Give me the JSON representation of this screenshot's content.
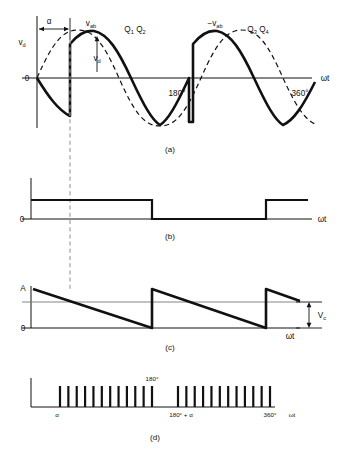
{
  "figure": {
    "panels": [
      {
        "id": "a",
        "label": "(a)"
      },
      {
        "id": "b",
        "label": "(b)"
      },
      {
        "id": "c",
        "label": "(c)"
      },
      {
        "id": "d",
        "label": "(d)"
      }
    ],
    "colors": {
      "ink": "#111111",
      "reference_line": "#777777",
      "dashed_guide": "#999999",
      "background": "#ffffff"
    }
  },
  "panel_a": {
    "y_axis_label": "v_d",
    "y_axis_label_html": "v<sub>d</sub>",
    "origin_label": "0",
    "x_axis_label": "ωt",
    "alpha_label": "α",
    "vab_label": "v_ab",
    "neg_vab_label": "−v_ab",
    "vd_arrow_label": "v_d",
    "thyristor_pair_1": "Q₁Q₂",
    "thyristor_pair_2": "Q₃Q₄",
    "tick_180": "180°",
    "tick_360": "360°"
  },
  "panel_b": {
    "origin_label": "0",
    "x_axis_label": "ωt"
  },
  "panel_c": {
    "amplitude_label": "A",
    "origin_label": "0",
    "x_axis_label": "ωt",
    "control_voltage_label": "V_c"
  },
  "panel_d": {
    "alpha_label": "α",
    "tick_180": "180°",
    "tick_180_plus_alpha": "180° + α",
    "tick_360": "360°",
    "x_axis_label": "ωt",
    "pulse_group_1_count": 12,
    "pulse_group_2_count": 12
  },
  "chart_data": {
    "type": "line",
    "xlabel": "ωt",
    "x_ticks": [
      0,
      180,
      360
    ],
    "x_tick_labels": [
      "0",
      "180°",
      "360°"
    ],
    "firing_angle_alpha_deg": 55,
    "subplots": [
      {
        "id": "a",
        "ylabel": "v_d",
        "description": "Output voltage v_d: solid rectified segments of v_ab with notches at firing angle alpha; dashed sinusoid is the underlying AC source.",
        "series": [
          {
            "name": "v_ab (source sine, dashed)",
            "style": "dashed",
            "x_deg": [
              0,
              30,
              60,
              90,
              120,
              150,
              180,
              210,
              240,
              270,
              300,
              330,
              360,
              390
            ],
            "values": [
              0,
              0.5,
              0.866,
              1.0,
              0.866,
              0.5,
              0,
              -0.5,
              -0.866,
              -1.0,
              -0.866,
              -0.5,
              0,
              0.5
            ]
          },
          {
            "name": "v_d (output, solid)",
            "style": "solid",
            "segments": [
              {
                "from_deg": 0,
                "to_deg": 55,
                "branch": "negative-sine"
              },
              {
                "from_deg": 55,
                "to_deg": 235,
                "branch": "positive-sine"
              },
              {
                "from_deg": 235,
                "to_deg": 415,
                "branch": "positive-sine-shifted"
              }
            ]
          }
        ],
        "annotations": [
          {
            "text": "α",
            "type": "span-arrow",
            "from_deg": 0,
            "to_deg": 55
          },
          {
            "text": "v_ab",
            "type": "peak-label",
            "at_deg": 90
          },
          {
            "text": "−v_ab",
            "type": "peak-label",
            "at_deg": 270
          },
          {
            "text": "v_d",
            "type": "vertical-arrow",
            "at_deg": 100
          },
          {
            "text": "Q₁Q₂",
            "type": "conduction-label",
            "at_deg": 130
          },
          {
            "text": "Q₃Q₄",
            "type": "conduction-label",
            "at_deg": 310
          }
        ]
      },
      {
        "id": "b",
        "description": "Gate drive logic level: high from 0 to alpha-offset block end, low, then high again near 360°.",
        "type": "square",
        "levels": [
          {
            "from_deg": 0,
            "to_deg": 190,
            "value": 1
          },
          {
            "from_deg": 190,
            "to_deg": 345,
            "value": 0
          },
          {
            "from_deg": 345,
            "to_deg": 400,
            "value": 1
          }
        ]
      },
      {
        "id": "c",
        "description": "Sawtooth ramp of amplitude A compared against control voltage V_c; intersections set the firing instants.",
        "type": "sawtooth",
        "amplitude": "A",
        "reference_level": 0.62,
        "reference_name": "V_c",
        "teeth": [
          {
            "start_deg": 0,
            "end_deg": 190
          },
          {
            "start_deg": 190,
            "end_deg": 380
          },
          {
            "start_deg": 380,
            "end_deg": 430
          }
        ]
      },
      {
        "id": "d",
        "description": "Gate pulse trains: first burst begins at alpha and runs to 180°, second burst begins at 180°+alpha and runs to 360°.",
        "type": "pulse-train",
        "groups": [
          {
            "start_label": "α",
            "end_label": "180°",
            "count": 12
          },
          {
            "start_label": "180° + α",
            "end_label": "360°",
            "count": 12
          }
        ]
      }
    ]
  }
}
